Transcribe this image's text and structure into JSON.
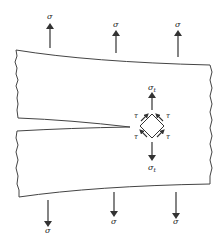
{
  "figure": {
    "applied_stress_label": "σ",
    "local_stress_label": "σ",
    "local_stress_subscript": "t",
    "shear_label": "τ",
    "colors": {
      "stroke": "#333333",
      "text": "#222222",
      "background": "#ffffff"
    }
  },
  "arrows_top": [
    {
      "x": 50,
      "label": "σ"
    },
    {
      "x": 116,
      "label": "σ"
    },
    {
      "x": 178,
      "label": "σ"
    }
  ],
  "arrows_bottom": [
    {
      "x": 48,
      "label": "σ"
    },
    {
      "x": 114,
      "label": "σ"
    },
    {
      "x": 176,
      "label": "σ"
    }
  ],
  "element": {
    "center": [
      152,
      126
    ],
    "shear_labels": [
      "τ",
      "τ",
      "τ",
      "τ"
    ]
  }
}
